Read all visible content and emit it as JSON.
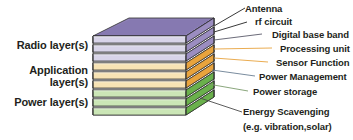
{
  "figure": {
    "background": "#ffffff"
  },
  "groups": [
    {
      "id": "radio",
      "label": "Radio layer(s)",
      "color_top": "#8f82b8",
      "color_right": "#9b8dc0",
      "color_left": "#cfc9e2",
      "color_front": "#d8d4e8"
    },
    {
      "id": "application",
      "label": "Application\nlayer(s)",
      "label_line1": "Application",
      "label_line2": "layer(s)",
      "color_top": "#e0a03a",
      "color_right": "#e8a33d",
      "color_left": "#f3d9a0",
      "color_front": "#f7e3b4"
    },
    {
      "id": "power",
      "label": "Power layer(s)",
      "color_top": "#5aa83f",
      "color_right": "#6ab04c",
      "color_left": "#b9dca2",
      "color_front": "#cbe6b6"
    }
  ],
  "layers": [
    {
      "index": 0,
      "group": "radio",
      "label": "Antenna"
    },
    {
      "index": 1,
      "group": "radio",
      "label": "rf circuit"
    },
    {
      "index": 2,
      "group": "radio",
      "label": "Digital base band"
    },
    {
      "index": 3,
      "group": "application",
      "label": "Processing unit"
    },
    {
      "index": 4,
      "group": "application",
      "label": "Sensor Function"
    },
    {
      "index": 5,
      "group": "application",
      "label": "Power Management"
    },
    {
      "index": 6,
      "group": "power",
      "label": "Power storage"
    },
    {
      "index": 7,
      "group": "power",
      "label": "Energy Scavenging"
    },
    {
      "index": 8,
      "group": "power",
      "label": "(e.g. vibration,solar)"
    }
  ],
  "labels_left": [
    {
      "id": "radio-group-label",
      "text": "Radio layer(s)"
    },
    {
      "id": "application-group-label-1",
      "text": "Application"
    },
    {
      "id": "application-group-label-2",
      "text": "layer(s)"
    },
    {
      "id": "power-group-label",
      "text": "Power layer(s)"
    }
  ],
  "labels_right": [
    {
      "id": "antenna-label",
      "text": "Antenna"
    },
    {
      "id": "rf-circuit-label",
      "text": "rf circuit"
    },
    {
      "id": "digital-base-band-label",
      "text": "Digital base band"
    },
    {
      "id": "processing-unit-label",
      "text": "Processing unit"
    },
    {
      "id": "sensor-function-label",
      "text": "Sensor Function"
    },
    {
      "id": "power-management-label",
      "text": "Power Management"
    },
    {
      "id": "power-storage-label",
      "text": "Power storage"
    },
    {
      "id": "energy-scavenging-label",
      "text": "Energy Scavenging"
    },
    {
      "id": "energy-scavenging-sub",
      "text": "(e.g. vibration,solar)"
    }
  ],
  "colors": {
    "text": "#231f20",
    "outline": "#2b2b2b",
    "leader_dark": "#3a3a3a",
    "leader_orange": "#e8a33d",
    "leader_gray": "#7d7d7d",
    "leader_green": "#8fbf78"
  }
}
